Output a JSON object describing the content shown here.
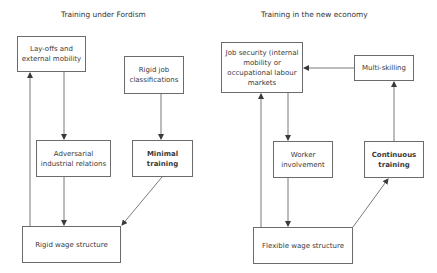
{
  "left_panel": {
    "title": "Training under Fordism",
    "nodes": {
      "layoffs": "Lay-offs and external mobility",
      "rigid_job": "Rigid job classifications",
      "adversarial": "Adversarial industrial relations",
      "minimal_training": "Minimal training",
      "rigid_wage": "Rigid wage structure"
    }
  },
  "right_panel": {
    "title": "Training in the new economy",
    "nodes": {
      "job_security": "Job security (internal mobility or occupational labour markets",
      "multi_skilling": "Multi-skilling",
      "worker_involvement": "Worker involvement",
      "continuous_training": "Continuous training",
      "flexible_wage": "Flexible wage structure"
    }
  },
  "edges": [
    {
      "from": "Lay-offs and external mobility",
      "to": "Adversarial industrial relations"
    },
    {
      "from": "Rigid job classifications",
      "to": "Minimal training"
    },
    {
      "from": "Adversarial industrial relations",
      "to": "Rigid wage structure"
    },
    {
      "from": "Minimal training",
      "to": "Rigid wage structure"
    },
    {
      "from": "Rigid wage structure",
      "to": "Lay-offs and external mobility"
    },
    {
      "from": "Multi-skilling",
      "to": "Job security"
    },
    {
      "from": "Job security",
      "to": "Worker involvement"
    },
    {
      "from": "Worker involvement",
      "to": "Flexible wage structure"
    },
    {
      "from": "Flexible wage structure",
      "to": "Job security"
    },
    {
      "from": "Flexible wage structure",
      "to": "Continuous training"
    },
    {
      "from": "Continuous training",
      "to": "Multi-skilling"
    }
  ],
  "colors": {
    "line": "#5a5a5a",
    "border": "#6b6b6b",
    "text": "#3a3a3a"
  }
}
